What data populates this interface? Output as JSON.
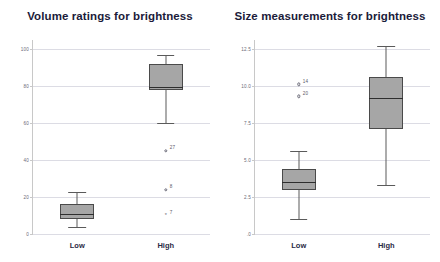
{
  "figure": {
    "background": "#ffffff",
    "box_fill": "#a6a6a6",
    "box_outline": "#4a4a4a",
    "grid_color": "#dcdce4",
    "axis_color": "#c8c8c8",
    "title_color": "#1b1b3a"
  },
  "panels": [
    {
      "id": "left",
      "title": "Volume ratings for brightness",
      "chart_data": {
        "type": "box",
        "title": "Volume ratings for brightness",
        "xlabel": "",
        "ylabel": "",
        "ylim": [
          0,
          105
        ],
        "yticks": [
          0,
          20,
          40,
          60,
          80,
          100
        ],
        "ytick_labels": [
          "0",
          "20",
          "40",
          "60",
          "80",
          "100"
        ],
        "grid": true,
        "legend": "none",
        "categories": [
          "Low",
          "High"
        ],
        "boxes": [
          {
            "category": "Low",
            "whisker_low": 4,
            "q1": 8,
            "median": 11,
            "q3": 16,
            "whisker_high": 23,
            "outliers": []
          },
          {
            "category": "High",
            "whisker_low": 60,
            "q1": 78,
            "median": 79.5,
            "q3": 92,
            "whisker_high": 97,
            "outliers": [
              {
                "value": 45,
                "label": "27",
                "kind": "mild"
              },
              {
                "value": 24,
                "label": "8",
                "kind": "mild"
              },
              {
                "value": 10,
                "label": "7",
                "kind": "extreme"
              }
            ]
          }
        ]
      }
    },
    {
      "id": "right",
      "title": "Size measurements for brightness",
      "chart_data": {
        "type": "box",
        "title": "Size measurements for brightness",
        "xlabel": "",
        "ylabel": "",
        "ylim": [
          0,
          13.1
        ],
        "yticks": [
          0,
          2.5,
          5.0,
          7.5,
          10.0,
          12.5
        ],
        "ytick_labels": [
          ".0",
          "2.5",
          "5.0",
          "7.5",
          "10.0",
          "12.5"
        ],
        "grid": true,
        "legend": "none",
        "categories": [
          "Low",
          "High"
        ],
        "boxes": [
          {
            "category": "Low",
            "whisker_low": 1.0,
            "q1": 3.0,
            "median": 3.5,
            "q3": 4.4,
            "whisker_high": 5.6,
            "outliers": [
              {
                "value": 10.1,
                "label": "14",
                "kind": "mild"
              },
              {
                "value": 9.3,
                "label": "20",
                "kind": "mild"
              }
            ]
          },
          {
            "category": "High",
            "whisker_low": 3.3,
            "q1": 7.1,
            "median": 9.2,
            "q3": 10.6,
            "whisker_high": 12.7,
            "outliers": []
          }
        ]
      }
    }
  ]
}
